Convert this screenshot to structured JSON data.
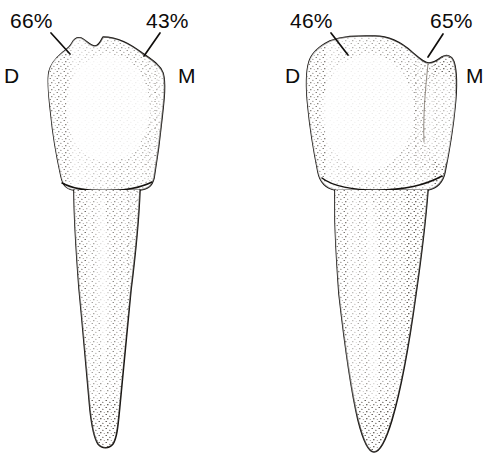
{
  "figure": {
    "background_color": "#ffffff",
    "ink_color": "#15120f",
    "width": 492,
    "height": 463
  },
  "teeth": [
    {
      "id": "left-tooth",
      "name": "first-premolar",
      "orientation_labels": {
        "distal": "D",
        "mesial": "M"
      },
      "annotations": [
        {
          "id": "left-distal-pct",
          "value": "66%",
          "side": "distal",
          "target": "distal marginal ridge"
        },
        {
          "id": "left-mesial-pct",
          "value": "43%",
          "side": "mesial",
          "target": "mesial marginal ridge"
        }
      ]
    },
    {
      "id": "right-tooth",
      "name": "second-premolar",
      "orientation_labels": {
        "distal": "D",
        "mesial": "M"
      },
      "annotations": [
        {
          "id": "right-distal-pct",
          "value": "46%",
          "side": "distal",
          "target": "distal marginal ridge"
        },
        {
          "id": "right-mesial-pct",
          "value": "65%",
          "side": "mesial",
          "target": "mesial marginal ridge"
        }
      ]
    }
  ],
  "labels": {
    "left_distal_pct": "66%",
    "left_mesial_pct": "43%",
    "left_d": "D",
    "left_m": "M",
    "right_distal_pct": "46%",
    "right_mesial_pct": "65%",
    "right_d": "D",
    "right_m": "M"
  }
}
